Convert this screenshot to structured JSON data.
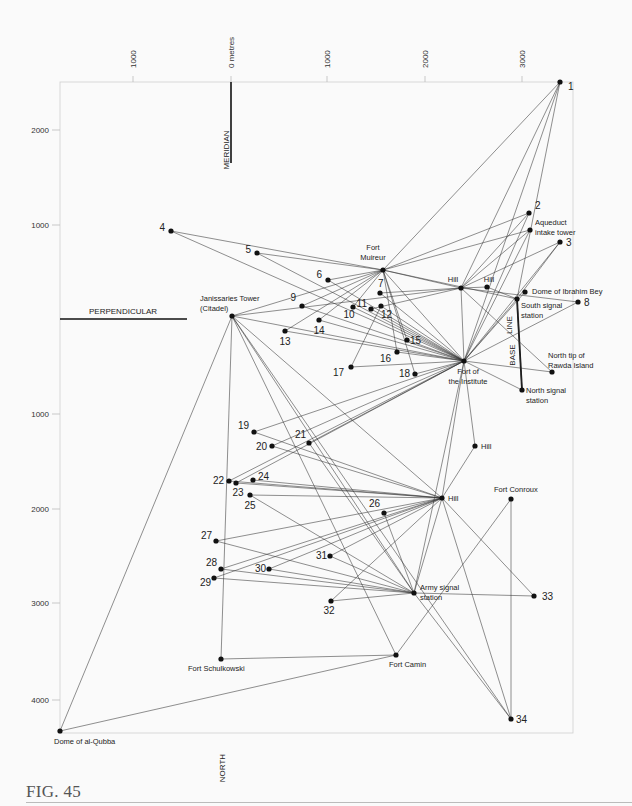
{
  "figure": {
    "caption": "FIG. 45",
    "x_axis": {
      "unit_label": "0 metres",
      "ticks": [
        {
          "label": "1000",
          "x": 133
        },
        {
          "label": "0 metres",
          "x": 231
        },
        {
          "label": "1000",
          "x": 327
        },
        {
          "label": "2000",
          "x": 425
        },
        {
          "label": "3000",
          "x": 522
        }
      ]
    },
    "y_axis": {
      "ticks": [
        {
          "label": "2000",
          "y": 130
        },
        {
          "label": "1000",
          "y": 225
        },
        {
          "label": "1000",
          "y": 414
        },
        {
          "label": "2000",
          "y": 509
        },
        {
          "label": "3000",
          "y": 603
        },
        {
          "label": "4000",
          "y": 700
        }
      ]
    },
    "reference_lines": {
      "meridian": "MERIDIAN",
      "perpendicular": "PERPENDICULAR",
      "north": "NORTH",
      "base_line_a": "BASE",
      "base_line_b": "LINE"
    }
  },
  "chart_data": {
    "type": "triangulation-network",
    "title": "FIG. 45",
    "frame": {
      "x0": 60,
      "y0": 82,
      "x1": 573,
      "y1": 733
    },
    "origin": {
      "x": 231,
      "y": 319,
      "label": "0 metres"
    },
    "axes": {
      "x_ticks_m": [
        -1000,
        0,
        1000,
        2000,
        3000
      ],
      "y_ticks_m_north": [
        2000,
        1000
      ],
      "y_ticks_m_south": [
        1000,
        2000,
        3000,
        4000
      ]
    },
    "points": [
      {
        "id": "1",
        "label": "1",
        "x": 560,
        "y": 82
      },
      {
        "id": "2",
        "label": "2",
        "x": 529,
        "y": 213
      },
      {
        "id": "aq",
        "label": "Aqueduct intake tower",
        "x": 530,
        "y": 230
      },
      {
        "id": "3",
        "label": "3",
        "x": 560,
        "y": 242
      },
      {
        "id": "4",
        "label": "4",
        "x": 171,
        "y": 231
      },
      {
        "id": "5",
        "label": "5",
        "x": 257,
        "y": 253
      },
      {
        "id": "fm",
        "label": "Fort Muireur",
        "x": 383,
        "y": 270
      },
      {
        "id": "6",
        "label": "6",
        "x": 328,
        "y": 280
      },
      {
        "id": "hill1",
        "label": "Hill",
        "x": 461,
        "y": 288
      },
      {
        "id": "hill2",
        "label": "Hill",
        "x": 487,
        "y": 287
      },
      {
        "id": "dib",
        "label": "Dome of Ibrahim Bey",
        "x": 525,
        "y": 292
      },
      {
        "id": "ss",
        "label": "South signal station",
        "x": 517,
        "y": 299
      },
      {
        "id": "8",
        "label": "8",
        "x": 578,
        "y": 302
      },
      {
        "id": "7",
        "label": "7",
        "x": 380,
        "y": 293
      },
      {
        "id": "9",
        "label": "9",
        "x": 302,
        "y": 306
      },
      {
        "id": "jt",
        "label": "Janissaries Tower (Citadel)",
        "x": 232,
        "y": 316
      },
      {
        "id": "11",
        "label": "11",
        "x": 371,
        "y": 309
      },
      {
        "id": "12",
        "label": "12",
        "x": 381,
        "y": 306
      },
      {
        "id": "10",
        "label": "10",
        "x": 353,
        "y": 307
      },
      {
        "id": "14",
        "label": "14",
        "x": 319,
        "y": 320
      },
      {
        "id": "13",
        "label": "13",
        "x": 285,
        "y": 331
      },
      {
        "id": "15",
        "label": "15",
        "x": 407,
        "y": 340
      },
      {
        "id": "16",
        "label": "16",
        "x": 397,
        "y": 352
      },
      {
        "id": "17",
        "label": "17",
        "x": 351,
        "y": 367
      },
      {
        "id": "18",
        "label": "18",
        "x": 415,
        "y": 374
      },
      {
        "id": "fi",
        "label": "Fort of the Institute",
        "x": 464,
        "y": 361
      },
      {
        "id": "rawda",
        "label": "North tip of Rawda Island",
        "x": 552,
        "y": 372
      },
      {
        "id": "ns",
        "label": "North signal station",
        "x": 522,
        "y": 390
      },
      {
        "id": "19",
        "label": "19",
        "x": 254,
        "y": 432
      },
      {
        "id": "hill3",
        "label": "Hill",
        "x": 475,
        "y": 446
      },
      {
        "id": "20",
        "label": "20",
        "x": 272,
        "y": 446
      },
      {
        "id": "21",
        "label": "21",
        "x": 309,
        "y": 443
      },
      {
        "id": "22",
        "label": "22",
        "x": 229,
        "y": 481
      },
      {
        "id": "23",
        "label": "23",
        "x": 236,
        "y": 483
      },
      {
        "id": "24",
        "label": "24",
        "x": 253,
        "y": 480
      },
      {
        "id": "25",
        "label": "25",
        "x": 250,
        "y": 495
      },
      {
        "id": "hill4",
        "label": "Hill",
        "x": 442,
        "y": 498
      },
      {
        "id": "fc",
        "label": "Fort Conroux",
        "x": 511,
        "y": 499
      },
      {
        "id": "26",
        "label": "26",
        "x": 384,
        "y": 513
      },
      {
        "id": "27",
        "label": "27",
        "x": 216,
        "y": 541
      },
      {
        "id": "31",
        "label": "31",
        "x": 330,
        "y": 556
      },
      {
        "id": "28",
        "label": "28",
        "x": 221,
        "y": 569
      },
      {
        "id": "30",
        "label": "30",
        "x": 269,
        "y": 569
      },
      {
        "id": "29",
        "label": "29",
        "x": 214,
        "y": 578
      },
      {
        "id": "as",
        "label": "Army signal station",
        "x": 414,
        "y": 593
      },
      {
        "id": "33",
        "label": "33",
        "x": 534,
        "y": 596
      },
      {
        "id": "32",
        "label": "32",
        "x": 331,
        "y": 601
      },
      {
        "id": "fcamin",
        "label": "Fort Camin",
        "x": 396,
        "y": 655
      },
      {
        "id": "fs",
        "label": "Fort Schulkowski",
        "x": 221,
        "y": 659
      },
      {
        "id": "34",
        "label": "34",
        "x": 511,
        "y": 719
      },
      {
        "id": "dq",
        "label": "Dome of al-Qubba",
        "x": 60,
        "y": 731
      }
    ],
    "edges": [
      [
        "1",
        "fm"
      ],
      [
        "1",
        "fi"
      ],
      [
        "1",
        "hill1"
      ],
      [
        "1",
        "ss"
      ],
      [
        "2",
        "fm"
      ],
      [
        "2",
        "hill1"
      ],
      [
        "2",
        "fi"
      ],
      [
        "aq",
        "fm"
      ],
      [
        "aq",
        "hill1"
      ],
      [
        "aq",
        "fi"
      ],
      [
        "3",
        "hill1"
      ],
      [
        "3",
        "fi"
      ],
      [
        "3",
        "ss"
      ],
      [
        "4",
        "fm"
      ],
      [
        "4",
        "fi"
      ],
      [
        "5",
        "fm"
      ],
      [
        "5",
        "fi"
      ],
      [
        "6",
        "fm"
      ],
      [
        "6",
        "fi"
      ],
      [
        "fm",
        "hill1"
      ],
      [
        "fm",
        "fi"
      ],
      [
        "fm",
        "ss"
      ],
      [
        "fm",
        "9"
      ],
      [
        "fm",
        "13"
      ],
      [
        "fm",
        "14"
      ],
      [
        "fm",
        "10"
      ],
      [
        "fm",
        "16"
      ],
      [
        "fm",
        "18"
      ],
      [
        "fm",
        "15"
      ],
      [
        "fm",
        "jt"
      ],
      [
        "hill1",
        "hill2"
      ],
      [
        "hill2",
        "ss"
      ],
      [
        "hill1",
        "fi"
      ],
      [
        "hill1",
        "7"
      ],
      [
        "hill1",
        "11"
      ],
      [
        "hill1",
        "jt"
      ],
      [
        "hill1",
        "rawda"
      ],
      [
        "dib",
        "fi"
      ],
      [
        "ss",
        "fi"
      ],
      [
        "8",
        "fi"
      ],
      [
        "8",
        "hill1"
      ],
      [
        "ss",
        "ns"
      ],
      [
        "ns",
        "fi"
      ],
      [
        "rawda",
        "fi"
      ],
      [
        "7",
        "fi"
      ],
      [
        "9",
        "fi"
      ],
      [
        "10",
        "fi"
      ],
      [
        "11",
        "fi"
      ],
      [
        "12",
        "fi"
      ],
      [
        "13",
        "fi"
      ],
      [
        "14",
        "fi"
      ],
      [
        "15",
        "fi"
      ],
      [
        "17",
        "fi"
      ],
      [
        "18",
        "fi"
      ],
      [
        "17",
        "12"
      ],
      [
        "16",
        "fi"
      ],
      [
        "jt",
        "fi"
      ],
      [
        "jt",
        "hill4"
      ],
      [
        "jt",
        "as"
      ],
      [
        "jt",
        "fcamin"
      ],
      [
        "jt",
        "fs"
      ],
      [
        "jt",
        "dq"
      ],
      [
        "jt",
        "34"
      ],
      [
        "19",
        "fi"
      ],
      [
        "19",
        "hill4"
      ],
      [
        "20",
        "fi"
      ],
      [
        "20",
        "hill4"
      ],
      [
        "21",
        "fi"
      ],
      [
        "21",
        "as"
      ],
      [
        "22",
        "fi"
      ],
      [
        "22",
        "hill4"
      ],
      [
        "23",
        "fi"
      ],
      [
        "23",
        "hill4"
      ],
      [
        "24",
        "hill4"
      ],
      [
        "25",
        "hill4"
      ],
      [
        "25",
        "as"
      ],
      [
        "fi",
        "hill3"
      ],
      [
        "fi",
        "hill4"
      ],
      [
        "fi",
        "as"
      ],
      [
        "hill3",
        "hill4"
      ],
      [
        "hill4",
        "26"
      ],
      [
        "hill4",
        "27"
      ],
      [
        "hill4",
        "28"
      ],
      [
        "hill4",
        "29"
      ],
      [
        "hill4",
        "30"
      ],
      [
        "hill4",
        "31"
      ],
      [
        "hill4",
        "32"
      ],
      [
        "hill4",
        "as"
      ],
      [
        "hill4",
        "33"
      ],
      [
        "hill4",
        "34"
      ],
      [
        "26",
        "as"
      ],
      [
        "27",
        "as"
      ],
      [
        "28",
        "as"
      ],
      [
        "29",
        "as"
      ],
      [
        "30",
        "as"
      ],
      [
        "31",
        "as"
      ],
      [
        "32",
        "as"
      ],
      [
        "as",
        "33"
      ],
      [
        "fc",
        "fcamin"
      ],
      [
        "fc",
        "34"
      ],
      [
        "fcamin",
        "fs"
      ],
      [
        "fcamin",
        "dq"
      ],
      [
        "as",
        "34"
      ]
    ]
  }
}
